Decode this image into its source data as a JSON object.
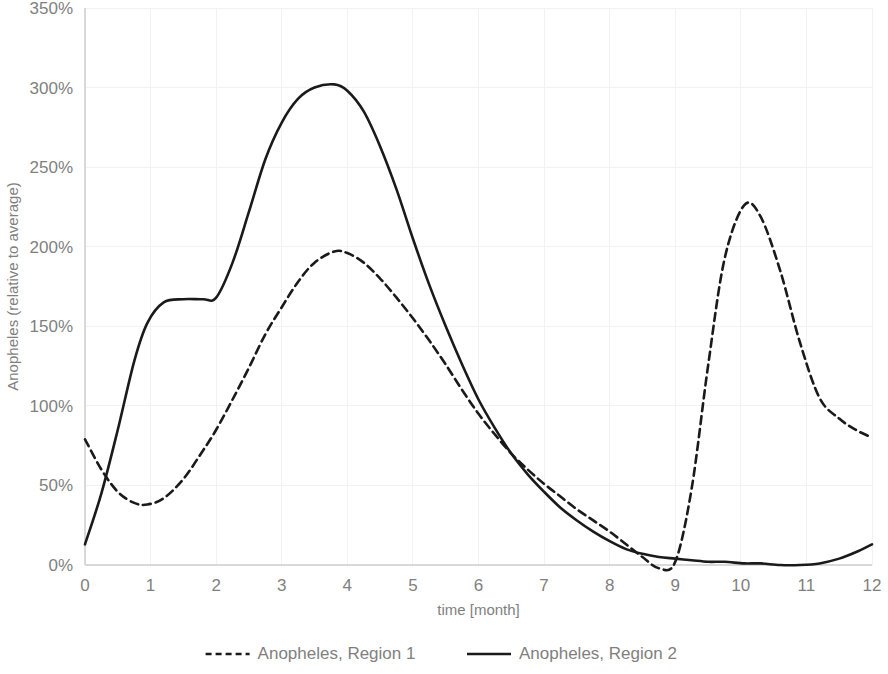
{
  "chart_data": {
    "type": "line",
    "title": "",
    "xlabel": "time [month]",
    "ylabel": "Anopheles (relative to average)",
    "xlim": [
      0,
      12
    ],
    "ylim": [
      0,
      350
    ],
    "xticks": [
      "0",
      "1",
      "2",
      "3",
      "4",
      "5",
      "6",
      "7",
      "8",
      "9",
      "10",
      "11",
      "12"
    ],
    "xtick_values": [
      0,
      1,
      2,
      3,
      4,
      5,
      6,
      7,
      8,
      9,
      10,
      11,
      12
    ],
    "yticks": [
      "0%",
      "50%",
      "100%",
      "150%",
      "200%",
      "250%",
      "300%",
      "350%"
    ],
    "ytick_values": [
      0,
      50,
      100,
      150,
      200,
      250,
      300,
      350
    ],
    "grid": true,
    "legend_position": "bottom",
    "x": [
      0,
      0.25,
      0.5,
      0.75,
      0.95,
      1.2,
      1.5,
      1.8,
      2,
      2.25,
      2.5,
      2.75,
      3,
      3.25,
      3.5,
      3.8,
      4,
      4.25,
      4.5,
      4.75,
      5,
      5.25,
      5.5,
      5.75,
      6,
      6.25,
      6.5,
      6.75,
      7,
      7.25,
      7.5,
      7.75,
      8,
      8.25,
      8.5,
      8.75,
      9,
      9.25,
      9.5,
      9.75,
      10.05,
      10.3,
      10.6,
      10.9,
      11.2,
      11.5,
      11.75,
      12
    ],
    "series": [
      {
        "name": "Anopheles, Region 1",
        "style": "dashed",
        "color": "#1a1a1a",
        "values": [
          79,
          60,
          46,
          39,
          38,
          42,
          54,
          72,
          85,
          104,
          124,
          145,
          162,
          178,
          190,
          197,
          196,
          190,
          180,
          168,
          155,
          141,
          126,
          110,
          95,
          82,
          70,
          60,
          51,
          43,
          35,
          28,
          21,
          13,
          5,
          -2,
          2,
          48,
          125,
          192,
          226,
          219,
          185,
          140,
          105,
          92,
          85,
          80
        ]
      },
      {
        "name": "Anopheles, Region 2",
        "style": "solid",
        "color": "#1a1a1a",
        "values": [
          13,
          45,
          85,
          128,
          152,
          165,
          167,
          167,
          168,
          190,
          222,
          255,
          278,
          293,
          300,
          302,
          298,
          285,
          263,
          236,
          205,
          176,
          150,
          126,
          104,
          86,
          70,
          57,
          46,
          36,
          28,
          21,
          15,
          10,
          7,
          5,
          4,
          3,
          2,
          2,
          1,
          1,
          0,
          0,
          1,
          4,
          8,
          13
        ]
      }
    ]
  },
  "legend": {
    "items": [
      {
        "label": "Anopheles, Region 1",
        "style": "dashed"
      },
      {
        "label": "Anopheles, Region 2",
        "style": "solid"
      }
    ]
  }
}
